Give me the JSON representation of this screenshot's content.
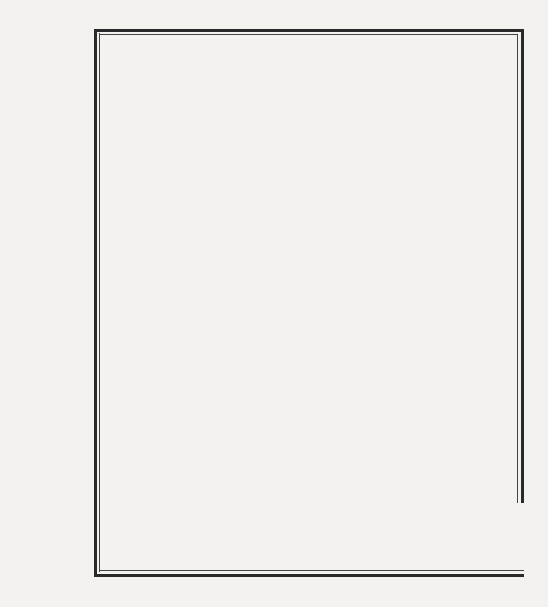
{
  "page_number": "2..",
  "row_labels": {
    "singular": "sg.",
    "plural": "pl.",
    "persons": [
      "I",
      "II",
      "III"
    ]
  },
  "blocks": [
    {
      "verbs": [
        {
          "infinitive": "scrivere",
          "forms": [
            "scrịssi",
            "scrivẹsti",
            "scrịsse",
            "scrivẹmmo",
            "scrivẹste",
            "scrịssero"
          ]
        },
        {
          "infinitive": "dire",
          "forms": [
            "dịssi",
            "dicẹsti",
            "dịsse",
            "dicẹmmo",
            "dicẹste",
            "dịssero"
          ]
        },
        {
          "infinitive": "bere",
          "forms": [
            "bẹvvi",
            "bevẹsti",
            "bẹvve",
            "bevẹmmo",
            "bevẹste",
            "bẹvvero"
          ]
        }
      ]
    },
    {
      "verbs": [
        {
          "infinitive": "fare",
          "forms": [
            "feci",
            "facesti",
            "fece",
            "facemmo",
            "faceste",
            "fecero"
          ]
        },
        {
          "infinitive": "conoscere",
          "forms": [
            "conobbi",
            "conoscesti",
            "conobbe",
            "conoscemmo",
            "conosceste",
            "conobbero"
          ]
        },
        {
          "infinitive": "crescere",
          "forms": [
            "crebbi",
            "crescesti",
            "crebbe",
            "crescemmo",
            "cresceste",
            "crebbero"
          ]
        }
      ]
    },
    {
      "verbs": [
        {
          "infinitive": "trarre",
          "forms": [
            "trassi",
            "traesti",
            "trasse",
            "traemmo",
            "traeste",
            "trassero"
          ]
        },
        {
          "infinitive": "comporre",
          "forms": [
            "composi",
            "componesti",
            "compose",
            "componemmo",
            "componeste",
            "composero"
          ]
        },
        {
          "infinitive": "produrre",
          "forms": [
            "produssi",
            "producesti",
            "produsse",
            "producemmo",
            "produceste",
            "produssero"
          ]
        }
      ]
    }
  ],
  "colors": {
    "ink": "#1c1c1c",
    "paper": "#f3f2ef"
  }
}
